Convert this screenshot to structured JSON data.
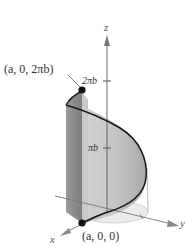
{
  "figure": {
    "type": "3d-helix-on-cylinder",
    "axes": {
      "z_label": "z",
      "y_label": "y",
      "x_label": "x"
    },
    "ticks": {
      "top": "2πb",
      "middle": "πb"
    },
    "points": {
      "top": "(a, 0, 2πb)",
      "bottom": "(a, 0, 0)"
    },
    "colors": {
      "surface_dark": "#8a8a8a",
      "surface_mid": "#b5b5b5",
      "surface_light": "#d8d8d8",
      "curve": "#1a1a1a",
      "axis": "#666666"
    }
  }
}
